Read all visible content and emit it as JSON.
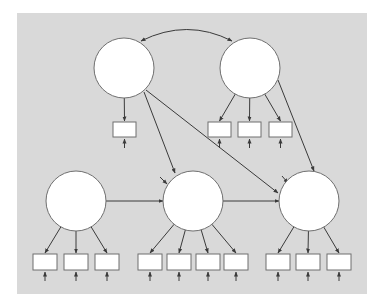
{
  "diagram": {
    "type": "structural-equation-model",
    "colors": {
      "page_background": "#ffffff",
      "panel_background": "#d9d9d9",
      "node_fill": "#ffffff",
      "stroke": "#6f6f6f",
      "arrow": "#3a3a3a"
    },
    "panel": {
      "x": 17,
      "y": 13,
      "width": 350,
      "height": 281
    },
    "latent_variables": [
      {
        "id": "L1",
        "cx": 124,
        "cy": 68,
        "r": 30
      },
      {
        "id": "L2",
        "cx": 250,
        "cy": 68,
        "r": 30
      },
      {
        "id": "L3",
        "cx": 76,
        "cy": 201,
        "r": 30
      },
      {
        "id": "L4",
        "cx": 193,
        "cy": 201,
        "r": 30
      },
      {
        "id": "L5",
        "cx": 309,
        "cy": 201,
        "r": 30
      }
    ],
    "indicators": [
      {
        "id": "x1",
        "latent": "L1",
        "x": 113,
        "y": 122,
        "w": 23,
        "h": 15
      },
      {
        "id": "x2",
        "latent": "L2",
        "x": 208,
        "y": 122,
        "w": 23,
        "h": 15
      },
      {
        "id": "x3",
        "latent": "L2",
        "x": 238,
        "y": 122,
        "w": 23,
        "h": 15
      },
      {
        "id": "x4",
        "latent": "L2",
        "x": 269,
        "y": 122,
        "w": 23,
        "h": 15
      },
      {
        "id": "y1",
        "latent": "L3",
        "x": 33,
        "y": 254,
        "w": 24,
        "h": 16
      },
      {
        "id": "y2",
        "latent": "L3",
        "x": 64,
        "y": 254,
        "w": 24,
        "h": 16
      },
      {
        "id": "y3",
        "latent": "L3",
        "x": 95,
        "y": 254,
        "w": 24,
        "h": 16
      },
      {
        "id": "y4",
        "latent": "L4",
        "x": 138,
        "y": 254,
        "w": 24,
        "h": 16
      },
      {
        "id": "y5",
        "latent": "L4",
        "x": 167,
        "y": 254,
        "w": 24,
        "h": 16
      },
      {
        "id": "y6",
        "latent": "L4",
        "x": 196,
        "y": 254,
        "w": 24,
        "h": 16
      },
      {
        "id": "y7",
        "latent": "L4",
        "x": 224,
        "y": 254,
        "w": 24,
        "h": 16
      },
      {
        "id": "y8",
        "latent": "L5",
        "x": 266,
        "y": 254,
        "w": 24,
        "h": 16
      },
      {
        "id": "y9",
        "latent": "L5",
        "x": 296,
        "y": 254,
        "w": 24,
        "h": 16
      },
      {
        "id": "y10",
        "latent": "L5",
        "x": 327,
        "y": 254,
        "w": 24,
        "h": 16
      }
    ],
    "structural_paths": [
      {
        "from": "L1",
        "to": "L4",
        "x1": 144,
        "y1": 92,
        "x2": 175,
        "y2": 173
      },
      {
        "from": "L1",
        "to": "L5",
        "x1": 146,
        "y1": 90,
        "x2": 278,
        "y2": 193
      },
      {
        "from": "L2",
        "to": "L5",
        "x1": 278,
        "y1": 80,
        "x2": 314,
        "y2": 171
      },
      {
        "from": "L3",
        "to": "L4",
        "x1": 106,
        "y1": 201,
        "x2": 163,
        "y2": 201
      },
      {
        "from": "L4",
        "to": "L5",
        "x1": 223,
        "y1": 201,
        "x2": 279,
        "y2": 201
      }
    ],
    "covariance": {
      "from": "L1",
      "to": "L2",
      "path": "M 141 41 Q 187 18 232 41"
    },
    "disturbances": [
      {
        "target": "L4",
        "x1": 160,
        "y1": 177,
        "x2": 167,
        "y2": 184
      },
      {
        "target": "L5",
        "x1": 282,
        "y1": 176,
        "x2": 288,
        "y2": 183
      }
    ]
  }
}
